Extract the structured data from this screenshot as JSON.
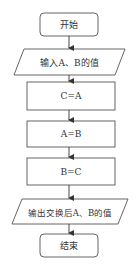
{
  "flowchart": {
    "nodes": [
      {
        "id": "start",
        "type": "terminal",
        "label": "开始"
      },
      {
        "id": "input",
        "type": "io",
        "label": "输入A、B的值"
      },
      {
        "id": "step1",
        "type": "process",
        "label": "C=A"
      },
      {
        "id": "step2",
        "type": "process",
        "label": "A=B"
      },
      {
        "id": "step3",
        "type": "process",
        "label": "B=C"
      },
      {
        "id": "output",
        "type": "io",
        "label": "输出交换后A、B的值"
      },
      {
        "id": "end",
        "type": "terminal",
        "label": "结束"
      }
    ],
    "edges": [
      [
        "start",
        "input"
      ],
      [
        "input",
        "step1"
      ],
      [
        "step1",
        "step2"
      ],
      [
        "step2",
        "step3"
      ],
      [
        "step3",
        "output"
      ],
      [
        "output",
        "end"
      ]
    ],
    "colors": {
      "stroke": "#555555",
      "text": "#333333",
      "background": "#ffffff"
    }
  }
}
